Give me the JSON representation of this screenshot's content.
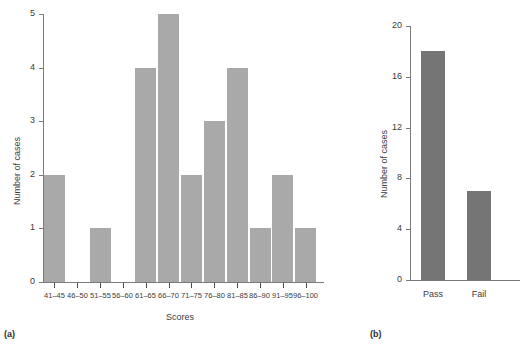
{
  "chart_data": [
    {
      "type": "bar",
      "id": "histogram-scores",
      "panel_tag": "(a)",
      "title": "",
      "xlabel": "Scores",
      "ylabel": "Number of cases",
      "categories": [
        "41-45",
        "46-50",
        "51-55",
        "56-60",
        "61-65",
        "66-70",
        "71-75",
        "76-80",
        "81-85",
        "86-90",
        "91-95",
        "96-100"
      ],
      "values": [
        2,
        0,
        1,
        0,
        4,
        5,
        2,
        3,
        4,
        1,
        2,
        1
      ],
      "ylim": [
        0,
        5
      ],
      "yticks": [
        0,
        1,
        2,
        3,
        4,
        5
      ],
      "ytick_labels": [
        "0",
        "1",
        "2",
        "3",
        "4",
        "5"
      ],
      "grid": false,
      "legend": "none",
      "bar_color": "#a9a9a9"
    },
    {
      "type": "bar",
      "id": "passfail-bar",
      "panel_tag": "(b)",
      "title": "",
      "xlabel": "",
      "ylabel": "Number of cases",
      "categories": [
        "Pass",
        "Fail"
      ],
      "values": [
        18,
        7
      ],
      "ylim": [
        0,
        20
      ],
      "yticks": [
        0,
        4,
        8,
        12,
        16,
        20
      ],
      "ytick_labels": [
        "0",
        "4",
        "8",
        "12",
        "16",
        "20"
      ],
      "grid": false,
      "legend": "none",
      "bar_color": "#757575"
    }
  ],
  "figure_a": {
    "panel_tag": "(a)",
    "ylabel": "Number of cases",
    "xlabel": "Scores"
  },
  "figure_b": {
    "panel_tag": "(b)",
    "ylabel": "Number of cases"
  }
}
